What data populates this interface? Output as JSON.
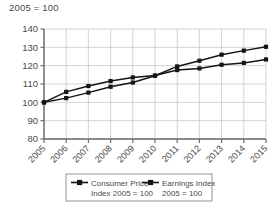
{
  "chart_data": {
    "type": "line",
    "title": "2005 = 100",
    "xlabel": "",
    "ylabel": "",
    "ylim": [
      80,
      140
    ],
    "yticks": [
      80,
      90,
      100,
      110,
      120,
      130,
      140
    ],
    "grid": true,
    "legend_position": "bottom",
    "categories": [
      "2005",
      "2006",
      "2007",
      "2008",
      "2009",
      "2010",
      "2011",
      "2012",
      "2013",
      "2014",
      "2015"
    ],
    "series": [
      {
        "name": "Consumer Price Index 2005 = 100",
        "legend_line1": "Consumer Price",
        "legend_line2": "Index 2005 = 100",
        "marker": "square",
        "color": "#141414",
        "values": [
          100,
          102.3,
          105.3,
          108.5,
          110.8,
          114.5,
          119.6,
          122.7,
          126.0,
          128.2,
          130.3
        ]
      },
      {
        "name": "Earnings Index 2005 = 100",
        "legend_line1": "Earnings Index",
        "legend_line2": "2005 = 100",
        "marker": "square",
        "color": "#141414",
        "values": [
          100,
          105.7,
          108.9,
          111.6,
          113.6,
          114.6,
          117.6,
          118.5,
          120.5,
          121.5,
          123.4
        ]
      }
    ]
  },
  "axis": {
    "ytick_labels": [
      "140",
      "130",
      "120",
      "110",
      "100",
      "90",
      "80"
    ],
    "xtick_labels": [
      "2005",
      "2006",
      "2007",
      "2008",
      "2009",
      "2010",
      "2011",
      "2012",
      "2013",
      "2014",
      "2015"
    ]
  },
  "colors": {
    "axis": "#6b6b6b",
    "grid": "#c8c8c8",
    "series": "#141414",
    "text": "#4a4a4a",
    "legend_border": "#8a8a8a"
  }
}
